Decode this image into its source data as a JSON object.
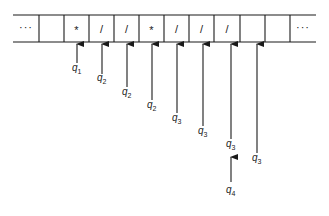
{
  "diagram": {
    "tape": {
      "top_y": 15,
      "bottom_y": 42,
      "line_start_x": 13,
      "line_end_x": 316,
      "cells": [
        {
          "x": 13,
          "w": 26,
          "symbol": "···",
          "type": "ellipsis"
        },
        {
          "x": 39,
          "w": 25,
          "symbol": ""
        },
        {
          "x": 64,
          "w": 25,
          "symbol": "*"
        },
        {
          "x": 89,
          "w": 25,
          "symbol": "/"
        },
        {
          "x": 114,
          "w": 25,
          "symbol": "/"
        },
        {
          "x": 139,
          "w": 25,
          "symbol": "*"
        },
        {
          "x": 164,
          "w": 25,
          "symbol": "/"
        },
        {
          "x": 189,
          "w": 25,
          "symbol": "/"
        },
        {
          "x": 214,
          "w": 26,
          "symbol": "/"
        },
        {
          "x": 240,
          "w": 25,
          "symbol": ""
        },
        {
          "x": 265,
          "w": 25,
          "symbol": ""
        },
        {
          "x": 290,
          "w": 26,
          "symbol": "···",
          "type": "ellipsis"
        }
      ]
    },
    "pointers": [
      {
        "x": 77,
        "y_top": 43,
        "y_bottom": 63,
        "state": "q",
        "sub": "1",
        "label_y": 71
      },
      {
        "x": 102,
        "y_top": 43,
        "y_bottom": 74,
        "state": "q",
        "sub": "2",
        "label_y": 81
      },
      {
        "x": 127,
        "y_top": 43,
        "y_bottom": 87,
        "state": "q",
        "sub": "2",
        "label_y": 95
      },
      {
        "x": 152,
        "y_top": 43,
        "y_bottom": 100,
        "state": "q",
        "sub": "2",
        "label_y": 108
      },
      {
        "x": 177,
        "y_top": 43,
        "y_bottom": 113,
        "state": "q",
        "sub": "3",
        "label_y": 121
      },
      {
        "x": 203,
        "y_top": 43,
        "y_bottom": 126,
        "state": "q",
        "sub": "3",
        "label_y": 134
      },
      {
        "x": 231,
        "y_top": 43,
        "y_bottom": 139,
        "state": "q",
        "sub": "3",
        "label_y": 147
      },
      {
        "x": 257,
        "y_top": 43,
        "y_bottom": 153,
        "state": "q",
        "sub": "3",
        "label_y": 161
      },
      {
        "x": 231,
        "y_top": 156,
        "y_bottom": 182,
        "state": "q",
        "sub": "4",
        "label_y": 193
      }
    ]
  }
}
